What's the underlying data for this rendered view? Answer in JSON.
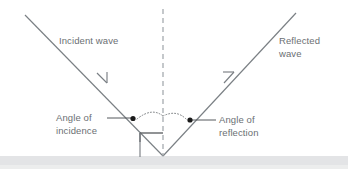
{
  "diagram": {
    "background_color": "#ffffff",
    "ray_color": "#7a7f84",
    "label_color": "#6b6f73",
    "ground_color": "#e3e4e6",
    "dot_color": "#1a1a1a",
    "labels": {
      "incident_wave": "Incident wave",
      "reflected_wave_line1": "Reflected",
      "reflected_wave_line2": "wave",
      "angle_of_incidence_line1": "Angle of",
      "angle_of_incidence_line2": "incidence",
      "angle_of_reflection_line1": "Angle of",
      "angle_of_reflection_line2": "reflection"
    },
    "icons": {
      "incident_arrow": "arrow-down-right-icon",
      "reflected_arrow": "arrow-up-right-icon",
      "normal": "dashed-normal-line-icon",
      "right_angle": "right-angle-marker-icon",
      "incidence_arc": "dotted-arc-icon",
      "reflection_arc": "dotted-arc-icon",
      "incidence_dot": "angle-dot-icon",
      "reflection_dot": "angle-dot-icon",
      "surface": "ground-surface-icon"
    },
    "geometry": {
      "vertex_x": 163,
      "vertex_y": 156,
      "incident_start_x": 25,
      "incident_start_y": 15,
      "reflected_end_x": 296,
      "reflected_end_y": 13,
      "normal_x": 163,
      "normal_top_y": 9,
      "normal_bottom_y": 156,
      "ground_y": 156,
      "incidence_dot_x": 133,
      "incidence_dot_y": 119,
      "reflection_dot_x": 190,
      "reflection_dot_y": 120
    }
  }
}
